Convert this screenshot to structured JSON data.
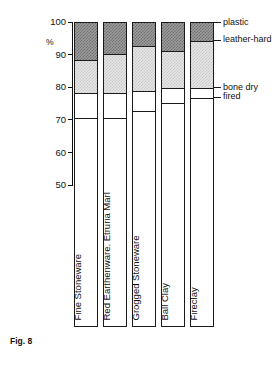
{
  "figure": {
    "caption": "Fig. 8"
  },
  "chart_data": {
    "type": "bar",
    "title": "",
    "subtitle": "",
    "xlabel": "",
    "ylabel": "%",
    "ylim": [
      50,
      100
    ],
    "yticks": [
      100,
      90,
      80,
      70,
      60,
      50
    ],
    "ytick_labels": [
      "100",
      "90",
      "80",
      "70",
      "60",
      "50"
    ],
    "grid": false,
    "stacked": true,
    "legend_position": "right",
    "annotations": [],
    "categories": [
      "Fine Stoneware",
      "Red Earthenware. Etruria Marl",
      "Grogged Stoneware",
      "Ball Clay",
      "Fireclay"
    ],
    "series": [
      {
        "name": "fired",
        "color": "#ffffff",
        "pattern": "solid-white",
        "values": [
          71.0,
          71.0,
          73.0,
          75.5,
          77.0
        ]
      },
      {
        "name": "bone dry",
        "color": "#ffffff",
        "pattern": "solid-white",
        "values": [
          7.5,
          7.5,
          6.0,
          4.5,
          3.0
        ]
      },
      {
        "name": "leather-hard",
        "color": "#e6e6e6",
        "pattern": "fine-checker-light",
        "values": [
          10.0,
          12.0,
          14.0,
          11.5,
          14.5
        ]
      },
      {
        "name": "plastic",
        "color": "#9d9d9d",
        "pattern": "fine-checker-dark",
        "values": [
          11.5,
          9.5,
          7.0,
          8.5,
          5.5
        ]
      }
    ],
    "cumulative_boundaries": [
      {
        "category": "Fine Stoneware",
        "fired_top": 71.0,
        "bone_dry_top": 78.5,
        "leather_hard_top": 88.5,
        "plastic_top": 100
      },
      {
        "category": "Red Earthenware. Etruria Marl",
        "fired_top": 71.0,
        "bone_dry_top": 78.5,
        "leather_hard_top": 90.5,
        "plastic_top": 100
      },
      {
        "category": "Grogged Stoneware",
        "fired_top": 73.0,
        "bone_dry_top": 79.0,
        "leather_hard_top": 93.0,
        "plastic_top": 100
      },
      {
        "category": "Ball Clay",
        "fired_top": 75.5,
        "bone_dry_top": 80.0,
        "leather_hard_top": 91.5,
        "plastic_top": 100
      },
      {
        "category": "Fireclay",
        "fired_top": 77.0,
        "bone_dry_top": 80.0,
        "leather_hard_top": 94.5,
        "plastic_top": 100
      }
    ],
    "legend": [
      {
        "label": "plastic",
        "color": "#9d9d9d"
      },
      {
        "label": "leather-hard",
        "color": "#e6e6e6"
      },
      {
        "label": "bone dry",
        "color": "#ffffff"
      },
      {
        "label": "fired",
        "color": "#ffffff"
      }
    ]
  }
}
